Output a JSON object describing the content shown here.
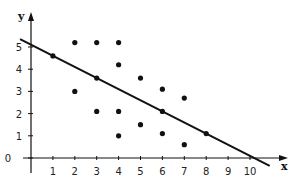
{
  "chart_data": {
    "type": "scatter",
    "title": "",
    "xlabel": "x",
    "ylabel": "y",
    "xlim": [
      -0.7,
      11.3
    ],
    "ylim": [
      -0.8,
      6.5
    ],
    "grid": false,
    "x_ticks": [
      "1",
      "2",
      "3",
      "4",
      "5",
      "6",
      "7",
      "8",
      "9",
      "10"
    ],
    "y_ticks": [
      "0",
      "1",
      "2",
      "3",
      "4",
      "5"
    ],
    "series": [
      {
        "name": "points",
        "points": [
          [
            1,
            4.6
          ],
          [
            2,
            5.2
          ],
          [
            3,
            5.2
          ],
          [
            4,
            5.2
          ],
          [
            4,
            4.2
          ],
          [
            2,
            3.0
          ],
          [
            3,
            3.6
          ],
          [
            5,
            3.6
          ],
          [
            6,
            3.1
          ],
          [
            7,
            2.7
          ],
          [
            3,
            2.1
          ],
          [
            4,
            2.1
          ],
          [
            6,
            2.1
          ],
          [
            5,
            1.5
          ],
          [
            4,
            1.0
          ],
          [
            6,
            1.1
          ],
          [
            7,
            0.6
          ],
          [
            8,
            1.1
          ]
        ]
      }
    ],
    "fit_line": {
      "name": "regression line",
      "intercept": 5.1,
      "slope": -0.5,
      "x_range": [
        -0.5,
        10.9
      ]
    }
  },
  "colors": {
    "ink": "#111111",
    "background": "#ffffff"
  }
}
